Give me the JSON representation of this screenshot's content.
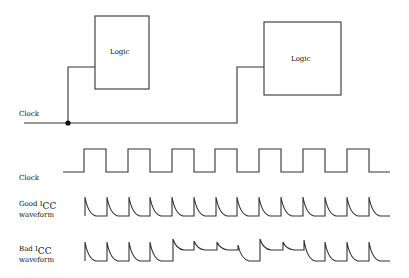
{
  "diagram": {
    "blocks": [
      {
        "id": "logic-left",
        "label": "Logic",
        "x": 95,
        "y": 16,
        "w": 54,
        "h": 73
      },
      {
        "id": "logic-right",
        "label": "Logic",
        "x": 264,
        "y": 22,
        "w": 77,
        "h": 73
      }
    ],
    "clock_net": {
      "label": "Clock",
      "junction": {
        "x": 68,
        "y": 123
      }
    },
    "waveforms": {
      "clock": {
        "label": "Clock"
      },
      "good_icc": {
        "label_line1_prefix": "Good I",
        "label_line1_sub": "CC",
        "label_line2": "waveform"
      },
      "bad_icc": {
        "label_line1_prefix": "Bad I",
        "label_line1_sub": "CC",
        "label_line2": "waveform"
      }
    },
    "colors": {
      "line": "#333333",
      "text": "#111111",
      "background": "#ffffff"
    }
  }
}
